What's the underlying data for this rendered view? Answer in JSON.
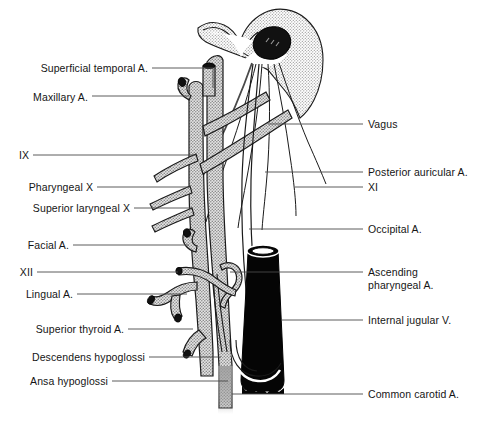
{
  "figure": {
    "colors": {
      "outline": "#1a1a1a",
      "vessel_fill": "#c9c9c9",
      "stipple": "#d8d8d8",
      "vein_fill": "#000000",
      "background": "#ffffff",
      "leader_line": "#4a4a4a"
    }
  },
  "labels_left": [
    {
      "id": "superficial-temporal-artery",
      "text": "Superficial temporal A.",
      "x": 17,
      "y": 62,
      "line_x1": 152,
      "line_x2": 213,
      "line_y": 68,
      "elbow_y": 88
    },
    {
      "id": "maxillary-artery",
      "text": "Maxillary A.",
      "x": 17,
      "y": 91,
      "line_x1": 92,
      "line_x2": 189,
      "line_y": 96,
      "elbow_y": 96
    },
    {
      "id": "cranial-nerve-ix",
      "text": "IX",
      "x": 17,
      "y": 149,
      "line_x1": 33,
      "line_x2": 196,
      "line_y": 155,
      "elbow_y": 155
    },
    {
      "id": "pharyngeal-x",
      "text": "Pharyngeal X",
      "x": 17,
      "y": 181,
      "line_x1": 97,
      "line_x2": 190,
      "line_y": 187,
      "elbow_y": 187
    },
    {
      "id": "superior-laryngeal-x",
      "text": "Superior laryngeal X",
      "x": 17,
      "y": 202,
      "line_x1": 134,
      "line_x2": 192,
      "line_y": 208,
      "elbow_y": 208
    },
    {
      "id": "facial-artery",
      "text": "Facial A.",
      "x": 17,
      "y": 239,
      "line_x1": 73,
      "line_x2": 189,
      "line_y": 245,
      "elbow_y": 245
    },
    {
      "id": "cranial-nerve-xii",
      "text": "XII",
      "x": 17,
      "y": 266,
      "line_x1": 37,
      "line_x2": 178,
      "line_y": 272,
      "elbow_y": 272
    },
    {
      "id": "lingual-artery",
      "text": "Lingual A.",
      "x": 17,
      "y": 288,
      "line_x1": 77,
      "line_x2": 187,
      "line_y": 294,
      "elbow_y": 294
    },
    {
      "id": "superior-thyroid-artery",
      "text": "Superior thyroid A.",
      "x": 17,
      "y": 323,
      "line_x1": 128,
      "line_x2": 193,
      "line_y": 329,
      "elbow_y": 329
    },
    {
      "id": "descendens-hypoglossi",
      "text": "Descendens hypoglossi",
      "x": 17,
      "y": 351,
      "line_x1": 149,
      "line_x2": 221,
      "line_y": 357,
      "elbow_y": 357
    },
    {
      "id": "ansa-hypoglossi",
      "text": "Ansa hypoglossi",
      "x": 17,
      "y": 375,
      "line_x1": 112,
      "line_x2": 228,
      "line_y": 381,
      "elbow_y": 381
    }
  ],
  "labels_right": [
    {
      "id": "vagus",
      "text": "Vagus",
      "x": 368,
      "y": 118,
      "line_x1": 268,
      "line_x2": 363,
      "line_y": 124
    },
    {
      "id": "posterior-auricular-artery",
      "text": "Posterior auricular A.",
      "x": 368,
      "y": 166,
      "line_x1": 265,
      "line_x2": 363,
      "line_y": 172
    },
    {
      "id": "cranial-nerve-xi",
      "text": "XI",
      "x": 368,
      "y": 181,
      "line_x1": 295,
      "line_x2": 363,
      "line_y": 187
    },
    {
      "id": "occipital-artery",
      "text": "Occipital A.",
      "x": 368,
      "y": 223,
      "line_x1": 249,
      "line_x2": 363,
      "line_y": 229
    },
    {
      "id": "ascending-pharyngeal-artery",
      "text": "Ascending\npharyngeal A.",
      "x": 368,
      "y": 266,
      "line_x1": 230,
      "line_x2": 363,
      "line_y": 272
    },
    {
      "id": "internal-jugular-vein",
      "text": "Internal jugular V.",
      "x": 368,
      "y": 314,
      "line_x1": 281,
      "line_x2": 363,
      "line_y": 320
    },
    {
      "id": "common-carotid-artery",
      "text": "Common carotid A.",
      "x": 368,
      "y": 388,
      "line_x1": 232,
      "line_x2": 363,
      "line_y": 394
    }
  ]
}
